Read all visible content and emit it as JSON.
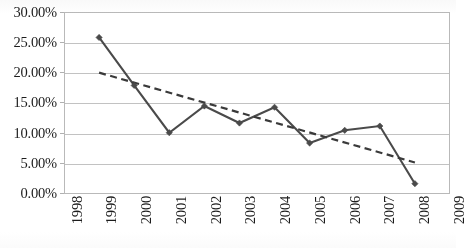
{
  "chart_data": {
    "type": "line",
    "title": "",
    "subtitle": "",
    "xlabel": "",
    "ylabel": "",
    "x": [
      1998,
      1999,
      2000,
      2001,
      2002,
      2003,
      2004,
      2005,
      2006,
      2007,
      2008,
      2009
    ],
    "categories": [
      "1998",
      "1999",
      "2000",
      "2001",
      "2002",
      "2003",
      "2004",
      "2005",
      "2006",
      "2007",
      "2008",
      "2009"
    ],
    "xlim": [
      1998,
      2009
    ],
    "ylim": [
      0,
      30
    ],
    "grid": true,
    "legend": "none",
    "y_tick_labels": [
      "30.00%",
      "25.00%",
      "20.00%",
      "15.00%",
      "10.00%",
      "5.00%",
      "0.00%"
    ],
    "y_tick_values": [
      30,
      25,
      20,
      15,
      10,
      5,
      0
    ],
    "series": [
      {
        "name": "data",
        "style": "solid-line-with-markers",
        "color": "#4a4a4a",
        "x": [
          1999,
          2000,
          2001,
          2002,
          2003,
          2004,
          2005,
          2006,
          2007,
          2008
        ],
        "values": [
          25.8,
          17.9,
          10.1,
          14.5,
          11.7,
          14.3,
          8.4,
          10.5,
          11.2,
          1.7
        ]
      },
      {
        "name": "trendline",
        "style": "dashed-linear-trend",
        "color": "#3a3a3a",
        "x": [
          1999,
          2008
        ],
        "values": [
          20.0,
          5.2
        ]
      }
    ]
  },
  "colors": {
    "series_line": "#4a4a4a",
    "trend_line": "#3a3a3a",
    "gridline": "#c2c2c2",
    "plot_border": "#b9b9b9",
    "background": "#ffffff",
    "text": "#1c1c1c"
  }
}
